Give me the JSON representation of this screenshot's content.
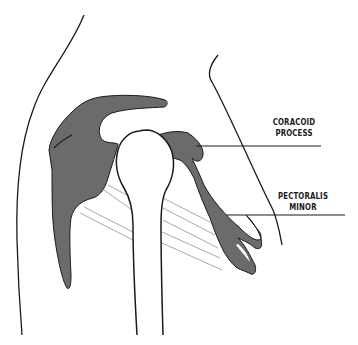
{
  "diagram": {
    "labels": {
      "coracoid_process": {
        "line1": "CORACOID",
        "line2": "PROCESS"
      },
      "pectoralis_minor": {
        "line1": "PECTORALIS",
        "line2": "MINOR"
      }
    },
    "colors": {
      "bone_fill": "#6b6b6b",
      "outline": "#1a1a1a",
      "ligament": "#a8a8a8",
      "background": "#ffffff",
      "text": "#1a1a1a"
    }
  }
}
